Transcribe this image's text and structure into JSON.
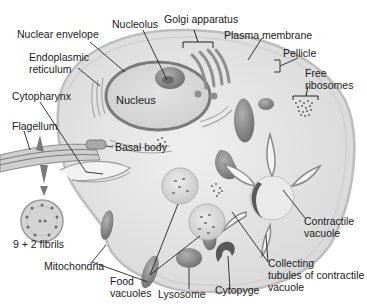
{
  "diagram": {
    "type": "labeled-cell-illustration",
    "colors": {
      "background": "#ffffff",
      "cytoplasm": "#e6e6e6",
      "membrane": "#c8c8c8",
      "organelle_dark": "#8a8a8a",
      "organelle_mid": "#b4b4b4",
      "label_text": "#1a1a1a",
      "leader_line": "#222222"
    },
    "labels": {
      "nucleolus": "Nucleolus",
      "golgi_apparatus": "Golgi apparatus",
      "nuclear_envelope": "Nuclear envelope",
      "plasma_membrane": "Plasma membrane",
      "endoplasmic_reticulum_1": "Endoplasmic",
      "endoplasmic_reticulum_2": "reticulum",
      "pellicle": "Pellicle",
      "free_ribosomes_1": "Free",
      "free_ribosomes_2": "ribosomes",
      "nucleus": "Nucleus",
      "cytopharynx": "Cytopharynx",
      "flagellum": "Flagellum",
      "basal_body": "Basal body",
      "fibrils": "9 + 2 fibrils",
      "contractile_vacuole_1": "Contractile",
      "contractile_vacuole_2": "vacuole",
      "mitochondria": "Mitochondria",
      "food_vacuoles_1": "Food",
      "food_vacuoles_2": "vacuoles",
      "lysosome": "Lysosome",
      "cytopyge": "Cytopyge",
      "collecting_tubules_1": "Collecting",
      "collecting_tubules_2": "tubules of contractile",
      "collecting_tubules_3": "vacuole"
    }
  }
}
